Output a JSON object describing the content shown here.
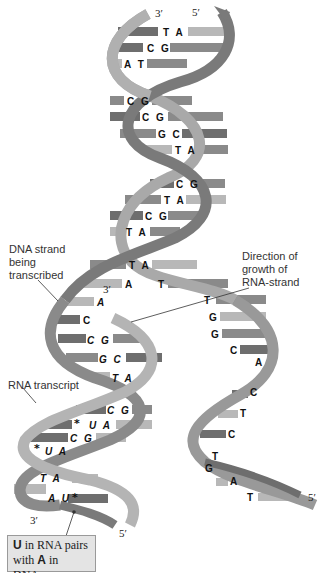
{
  "figure": {
    "colors": {
      "strand_dark": "#7a7a7a",
      "strand_light": "#a9a9a9",
      "base_dark": "#6e6e6e",
      "base_light": "#b8b8b8",
      "callout_bg": "#e4e4e4"
    }
  },
  "ends": {
    "top_left": "3′",
    "top_right": "5′",
    "rna_end": "3′",
    "bottom_left": "3′",
    "bottom_mid": "5′",
    "bottom_right": "5′"
  },
  "labels": {
    "dna_strand": [
      "DNA strand",
      "being",
      "transcribed"
    ],
    "direction": [
      "Direction of",
      "growth of",
      "RNA-strand"
    ],
    "rna_transcript": "RNA transcript",
    "callout_line1_bold": "U",
    "callout_line1_rest": " in RNA pairs",
    "callout_line2_pre": "with ",
    "callout_line2_bold": "A",
    "callout_line2_rest": " in DNA."
  },
  "double_helix_pairs": [
    {
      "text": "T A",
      "x": 163,
      "y": 28
    },
    {
      "text": "C G",
      "x": 147,
      "y": 44
    },
    {
      "text": "A T",
      "x": 124,
      "y": 60
    },
    {
      "text": "C G",
      "x": 127,
      "y": 97
    },
    {
      "text": "C G",
      "x": 142,
      "y": 113
    },
    {
      "text": "G C",
      "x": 158,
      "y": 130
    },
    {
      "text": "T A",
      "x": 175,
      "y": 146
    },
    {
      "text": "C G",
      "x": 176,
      "y": 180
    },
    {
      "text": "T A",
      "x": 164,
      "y": 196
    },
    {
      "text": "C G",
      "x": 145,
      "y": 212
    },
    {
      "text": "T A",
      "x": 126,
      "y": 228
    },
    {
      "text": "T A",
      "x": 129,
      "y": 261
    }
  ],
  "unwound_bases": {
    "coding_strand": [
      {
        "text": "T",
        "x": 158,
        "y": 280
      },
      {
        "text": "T",
        "x": 204,
        "y": 296
      },
      {
        "text": "G",
        "x": 209,
        "y": 313
      },
      {
        "text": "G",
        "x": 211,
        "y": 330
      },
      {
        "text": "C",
        "x": 230,
        "y": 346
      },
      {
        "text": "A",
        "x": 255,
        "y": 358
      },
      {
        "text": "C",
        "x": 250,
        "y": 388
      },
      {
        "text": "T",
        "x": 240,
        "y": 409
      },
      {
        "text": "C",
        "x": 228,
        "y": 430
      },
      {
        "text": "T",
        "x": 212,
        "y": 452
      },
      {
        "text": "G",
        "x": 205,
        "y": 464
      },
      {
        "text": "A",
        "x": 230,
        "y": 477
      },
      {
        "text": "T",
        "x": 247,
        "y": 493
      }
    ],
    "template_strand": [
      {
        "text": "A",
        "x": 125,
        "y": 280
      },
      {
        "text": "A",
        "x": 97,
        "y": 298
      },
      {
        "text": "C",
        "x": 83,
        "y": 316
      }
    ]
  },
  "hybrid_pairs": [
    {
      "text": "C G",
      "x": 87,
      "y": 336
    },
    {
      "text": "G C",
      "x": 99,
      "y": 355
    },
    {
      "text": "T A",
      "x": 112,
      "y": 374
    },
    {
      "text": "C G",
      "x": 107,
      "y": 406
    },
    {
      "text": "U A",
      "x": 89,
      "y": 421
    },
    {
      "text": "C G",
      "x": 70,
      "y": 434
    },
    {
      "text": "U A",
      "x": 45,
      "y": 447
    },
    {
      "text": "T A",
      "x": 40,
      "y": 474
    },
    {
      "text": "A U",
      "x": 48,
      "y": 494
    }
  ],
  "stars": [
    {
      "x": 74,
      "y": 420
    },
    {
      "x": 34,
      "y": 445
    },
    {
      "x": 72,
      "y": 494
    }
  ]
}
